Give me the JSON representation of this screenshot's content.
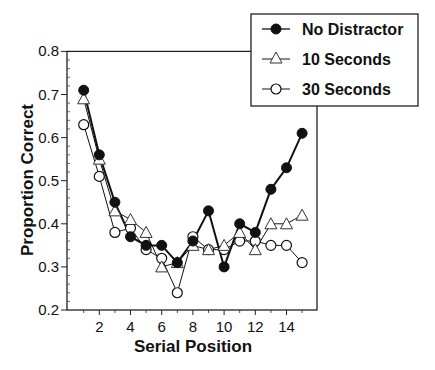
{
  "chart_data": {
    "type": "line",
    "title": "",
    "xlabel": "Serial Position",
    "ylabel": "Proportion Correct",
    "x": [
      1,
      2,
      3,
      4,
      5,
      6,
      7,
      8,
      9,
      10,
      11,
      12,
      13,
      14,
      15
    ],
    "xticks": [
      2,
      4,
      6,
      8,
      10,
      12,
      14
    ],
    "xtick_labels": [
      "2",
      "4",
      "6",
      "8",
      "10",
      "12",
      "14"
    ],
    "xlim": [
      0.0,
      16.0
    ],
    "yticks": [
      0.2,
      0.3,
      0.4,
      0.5,
      0.6,
      0.7,
      0.8
    ],
    "ytick_labels": [
      "0.2",
      "0.3",
      "0.4",
      "0.5",
      "0.6",
      "0.7",
      "0.8"
    ],
    "ylim": [
      0.2,
      0.8
    ],
    "grid": false,
    "legend_position": "upper right (outside, overlapping plot corner)",
    "series": [
      {
        "name": "No Distractor",
        "marker": "filled-circle",
        "line_width": 2,
        "values": [
          0.71,
          0.56,
          0.45,
          0.37,
          0.35,
          0.35,
          0.31,
          0.36,
          0.43,
          0.3,
          0.4,
          0.38,
          0.48,
          0.53,
          0.61
        ]
      },
      {
        "name": "10 Seconds",
        "marker": "open-triangle",
        "line_width": 1,
        "values": [
          0.69,
          0.55,
          0.43,
          0.41,
          0.38,
          0.3,
          0.31,
          0.35,
          0.34,
          0.35,
          0.38,
          0.34,
          0.4,
          0.4,
          0.42
        ]
      },
      {
        "name": "30 Seconds",
        "marker": "open-circle",
        "line_width": 1,
        "values": [
          0.63,
          0.51,
          0.38,
          0.39,
          0.34,
          0.32,
          0.24,
          0.37,
          0.34,
          0.34,
          0.36,
          0.36,
          0.35,
          0.35,
          0.31
        ]
      }
    ]
  },
  "legend": {
    "items": [
      {
        "label": "No Distractor"
      },
      {
        "label": "10 Seconds"
      },
      {
        "label": "30 Seconds"
      }
    ]
  },
  "axes": {
    "x_title": "Serial Position",
    "y_title": "Proportion Correct"
  }
}
